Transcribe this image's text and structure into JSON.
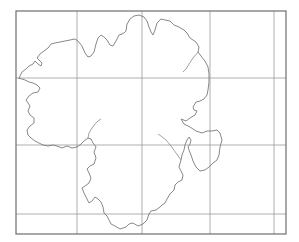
{
  "map": {
    "type": "blank-outline-map",
    "grid": {
      "columns": 5,
      "rows": 4
    },
    "colors": {
      "frame": "#6e6e6e",
      "grid": "#9a9a9a",
      "outline": "#7a7a7a",
      "background": "#ffffff"
    },
    "labels": []
  }
}
